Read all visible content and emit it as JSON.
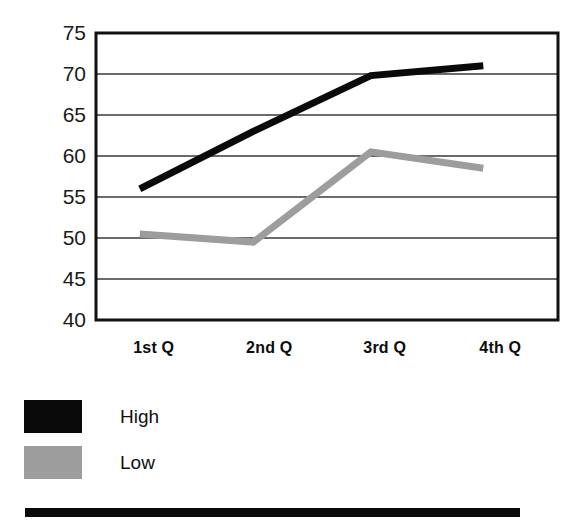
{
  "chart_data": {
    "type": "line",
    "title": "",
    "subtitle": "",
    "xlabel": "",
    "ylabel": "",
    "categories": [
      "1st Q",
      "2nd Q",
      "3rd Q",
      "4th Q"
    ],
    "series": [
      {
        "name": "High",
        "color": "#0a0a0a",
        "values": [
          56,
          63,
          69.8,
          71
        ]
      },
      {
        "name": "Low",
        "color": "#9d9d9d",
        "values": [
          50.5,
          49.5,
          60.5,
          58.5
        ]
      }
    ],
    "ylim": [
      40,
      75
    ],
    "yticks": [
      75,
      70,
      65,
      60,
      55,
      50,
      45,
      40
    ],
    "ytick_labels": [
      "75",
      "70",
      "65",
      "60",
      "55",
      "50",
      "45",
      "40"
    ],
    "grid": true,
    "grid_axis": "y",
    "legend_position": "below-left",
    "legend": [
      {
        "label": "High",
        "swatch": "#0a0a0a"
      },
      {
        "label": "Low",
        "swatch": "#9d9d9d"
      }
    ],
    "plot_frame": true,
    "frame_color": "#111111",
    "gridline_color": "#3a3a3a",
    "background": "#ffffff",
    "annotations": []
  },
  "decor": {
    "bottom_bar_color": "#0a0a0a"
  }
}
